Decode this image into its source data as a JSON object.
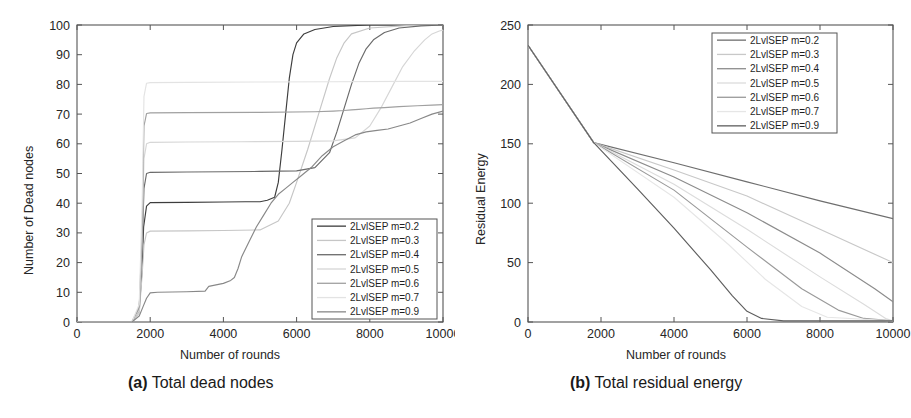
{
  "figure": {
    "panels": [
      {
        "id": "a",
        "caption_tag": "(a)",
        "caption_text": "Total dead nodes"
      },
      {
        "id": "b",
        "caption_tag": "(b)",
        "caption_text": "Total residual energy"
      }
    ]
  },
  "chart_data": [
    {
      "type": "line",
      "panel": "a",
      "title": "(a) Total dead nodes",
      "xlabel": "Number of rounds",
      "ylabel": "Number of Dead nodes",
      "xlim": [
        0,
        10000
      ],
      "ylim": [
        0,
        100
      ],
      "xticks": [
        0,
        2000,
        4000,
        6000,
        8000,
        10000
      ],
      "xticklabels": [
        "0",
        "2000",
        "4000",
        "6000",
        "8000",
        "10000"
      ],
      "yticks": [
        0,
        10,
        20,
        30,
        40,
        50,
        60,
        70,
        80,
        90,
        100
      ],
      "yticklabels": [
        "0",
        "10",
        "20",
        "30",
        "40",
        "50",
        "60",
        "70",
        "80",
        "90",
        "100"
      ],
      "grid": false,
      "legend_position": "lower-right",
      "series": [
        {
          "name": "2LvlSEP m=0.2",
          "color": "#3d3d3d",
          "dash": "none",
          "x": [
            0,
            1500,
            1700,
            1780,
            1820,
            1900,
            2000,
            3000,
            4000,
            4600,
            5000,
            5200,
            5400,
            5500,
            5600,
            5700,
            5800,
            5900,
            6000,
            6200,
            6500,
            7000,
            8000,
            9000,
            10000
          ],
          "y": [
            0,
            0,
            4,
            18,
            32,
            39,
            40.2,
            40.3,
            40.4,
            40.5,
            40.5,
            41,
            42,
            47,
            58,
            70,
            82,
            90,
            94,
            97,
            98.5,
            99.5,
            100,
            100,
            100
          ]
        },
        {
          "name": "2LvlSEP m=0.3",
          "color": "#c6c6c6",
          "dash": "none",
          "x": [
            0,
            1500,
            1700,
            1780,
            1830,
            1900,
            2000,
            3000,
            4000,
            5000,
            5500,
            5800,
            6000,
            6300,
            6600,
            6900,
            7100,
            7300,
            7500,
            8000,
            9000,
            10000
          ],
          "y": [
            0,
            0,
            3,
            16,
            26,
            30,
            30.6,
            30.7,
            30.8,
            31,
            34,
            40,
            47,
            58,
            70,
            82,
            89,
            94,
            97,
            99,
            99.8,
            100
          ]
        },
        {
          "name": "2LvlSEP m=0.4",
          "color": "#6a6a6a",
          "dash": "none",
          "x": [
            0,
            1500,
            1700,
            1780,
            1830,
            1900,
            2000,
            3000,
            4000,
            5000,
            6000,
            6500,
            6900,
            7100,
            7300,
            7500,
            7700,
            7900,
            8100,
            8400,
            8800,
            9400,
            10000
          ],
          "y": [
            0,
            0,
            5,
            24,
            45,
            50,
            50.4,
            50.5,
            50.6,
            50.7,
            50.9,
            52,
            57,
            64,
            72,
            80,
            87,
            92,
            95,
            97.5,
            99,
            99.7,
            100
          ]
        },
        {
          "name": "2LvlSEP m=0.5",
          "color": "#d6d6d6",
          "dash": "none",
          "x": [
            0,
            1500,
            1700,
            1780,
            1830,
            1900,
            2000,
            3000,
            4500,
            6000,
            7000,
            7600,
            8000,
            8300,
            8600,
            8900,
            9200,
            9500,
            9700,
            9900,
            10000
          ],
          "y": [
            0,
            0,
            4,
            28,
            55,
            60,
            60.5,
            60.6,
            60.7,
            60.8,
            61,
            62,
            66,
            72,
            79,
            86,
            91,
            95,
            97,
            98,
            98.3
          ]
        },
        {
          "name": "2LvlSEP m=0.6",
          "color": "#a0a0a0",
          "dash": "none",
          "x": [
            0,
            1500,
            1700,
            1780,
            1830,
            1900,
            2000,
            3000,
            5000,
            6500,
            7000,
            7300,
            7500,
            7700,
            7900,
            8100,
            8400,
            8800,
            9300,
            9700,
            10000
          ],
          "y": [
            0,
            0,
            5,
            30,
            66,
            70.2,
            70.4,
            70.5,
            70.6,
            70.8,
            71,
            71.2,
            71.4,
            71.6,
            71.8,
            72,
            72.2,
            72.5,
            72.8,
            73,
            73.2
          ]
        },
        {
          "name": "2LvlSEP m=0.7",
          "color": "#e3e3e3",
          "dash": "none",
          "x": [
            0,
            1500,
            1700,
            1780,
            1830,
            1900,
            2000,
            3000,
            5000,
            7000,
            9000,
            10000
          ],
          "y": [
            0,
            0,
            6,
            40,
            76,
            80.4,
            80.6,
            80.7,
            80.8,
            80.9,
            81,
            81
          ]
        },
        {
          "name": "2LvlSEP m=0.9",
          "color": "#888888",
          "dash": "none",
          "x": [
            0,
            1500,
            1700,
            1800,
            1900,
            2000,
            2200,
            3000,
            3500,
            3600,
            3800,
            4000,
            4200,
            4300,
            4400,
            4500,
            4700,
            4900,
            5100,
            5300,
            5500,
            5700,
            5900,
            6100,
            6400,
            6700,
            7000,
            7300,
            7600,
            7900,
            8200,
            8500,
            8800,
            9100,
            9400,
            9700,
            10000
          ],
          "y": [
            0,
            0,
            2,
            5,
            8,
            9.8,
            10,
            10.2,
            10.4,
            12,
            12.5,
            13,
            14,
            15,
            18,
            22,
            27,
            32,
            36,
            40,
            43,
            45,
            47,
            49,
            52,
            56,
            59,
            61,
            63,
            64,
            64.5,
            65,
            66,
            67,
            68.5,
            70,
            71
          ]
        }
      ]
    },
    {
      "type": "line",
      "panel": "b",
      "title": "(b) Total residual energy",
      "xlabel": "Number of rounds",
      "ylabel": "Residual Energy",
      "xlim": [
        0,
        10000
      ],
      "ylim": [
        0,
        250
      ],
      "xticks": [
        0,
        2000,
        4000,
        6000,
        8000,
        10000
      ],
      "xticklabels": [
        "0",
        "2000",
        "4000",
        "6000",
        "8000",
        "10000"
      ],
      "yticks": [
        0,
        50,
        100,
        150,
        200,
        250
      ],
      "yticklabels": [
        "0",
        "50",
        "100",
        "150",
        "200",
        "250"
      ],
      "grid": false,
      "legend_position": "upper-right",
      "series": [
        {
          "name": "2LvlSEP m=0.2",
          "color": "#6e6e6e",
          "dash": "none",
          "x": [
            0,
            1800,
            4000,
            6000,
            8000,
            10000
          ],
          "y": [
            233,
            151,
            134,
            118,
            102,
            87
          ]
        },
        {
          "name": "2LvlSEP m=0.3",
          "color": "#c8c8c8",
          "dash": "none",
          "x": [
            0,
            1800,
            4000,
            6000,
            8000,
            10000
          ],
          "y": [
            233,
            151,
            128,
            106,
            78,
            50
          ]
        },
        {
          "name": "2LvlSEP m=0.4",
          "color": "#8c8c8c",
          "dash": "none",
          "x": [
            0,
            1800,
            4000,
            6000,
            8000,
            9500,
            10000
          ],
          "y": [
            233,
            151,
            122,
            92,
            58,
            28,
            17
          ]
        },
        {
          "name": "2LvlSEP m=0.5",
          "color": "#dcdcdc",
          "dash": "none",
          "x": [
            0,
            1800,
            4000,
            6000,
            8000,
            9200,
            9800,
            10000
          ],
          "y": [
            233,
            151,
            116,
            78,
            38,
            15,
            3,
            1
          ]
        },
        {
          "name": "2LvlSEP m=0.6",
          "color": "#9a9a9a",
          "dash": "none",
          "x": [
            0,
            1800,
            4000,
            6000,
            7500,
            8500,
            9200,
            10000
          ],
          "y": [
            233,
            151,
            111,
            63,
            28,
            10,
            3,
            1
          ]
        },
        {
          "name": "2LvlSEP m=0.7",
          "color": "#e6e6e6",
          "dash": "none",
          "x": [
            0,
            1800,
            4000,
            5500,
            6500,
            7500,
            8200,
            10000
          ],
          "y": [
            233,
            151,
            105,
            65,
            36,
            13,
            4,
            1
          ]
        },
        {
          "name": "2LvlSEP m=0.9",
          "color": "#5e5e5e",
          "dash": "none",
          "x": [
            0,
            1800,
            3000,
            4000,
            5000,
            5600,
            6000,
            6400,
            7000,
            10000
          ],
          "y": [
            233,
            151,
            112,
            79,
            44,
            22,
            9,
            3,
            1,
            1
          ]
        }
      ]
    }
  ]
}
